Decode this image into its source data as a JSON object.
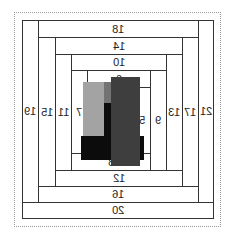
{
  "diagram": {
    "type": "log-cabin quilt block (mirrored)",
    "strips": [
      {
        "label": "21",
        "x": 198,
        "y": 20,
        "w": 16,
        "h": 183
      },
      {
        "label": "20",
        "x": 22,
        "y": 202,
        "w": 192,
        "h": 17
      },
      {
        "label": "19",
        "x": 22,
        "y": 20,
        "w": 17,
        "h": 183
      },
      {
        "label": "18",
        "x": 38,
        "y": 20,
        "w": 161,
        "h": 18
      },
      {
        "label": "17",
        "x": 182,
        "y": 37,
        "w": 17,
        "h": 150
      },
      {
        "label": "16",
        "x": 38,
        "y": 186,
        "w": 161,
        "h": 17
      },
      {
        "label": "15",
        "x": 38,
        "y": 37,
        "w": 18,
        "h": 150
      },
      {
        "label": "14",
        "x": 55,
        "y": 37,
        "w": 128,
        "h": 18
      },
      {
        "label": "13",
        "x": 166,
        "y": 54,
        "w": 17,
        "h": 117
      },
      {
        "label": "12",
        "x": 55,
        "y": 170,
        "w": 128,
        "h": 17
      },
      {
        "label": "11",
        "x": 55,
        "y": 54,
        "w": 17,
        "h": 117
      },
      {
        "label": "10",
        "x": 71,
        "y": 54,
        "w": 96,
        "h": 17
      },
      {
        "label": "9",
        "x": 150,
        "y": 70,
        "w": 17,
        "h": 101
      },
      {
        "label": "8",
        "x": 71,
        "y": 153,
        "w": 80,
        "h": 18
      },
      {
        "label": "7",
        "x": 71,
        "y": 70,
        "w": 17,
        "h": 84
      },
      {
        "label": "6",
        "x": 87,
        "y": 70,
        "w": 64,
        "h": 18
      },
      {
        "label": "5",
        "x": 134,
        "y": 87,
        "w": 17,
        "h": 67
      }
    ],
    "blocks": [
      {
        "name": "light-gray-block",
        "color": "#a3a3a3",
        "x": 83,
        "y": 82,
        "w": 21,
        "h": 56
      },
      {
        "name": "medium-gray-block",
        "color": "#737373",
        "x": 104,
        "y": 82,
        "w": 8,
        "h": 22
      },
      {
        "name": "black-block",
        "color": "#0c0c0c",
        "x": 104,
        "y": 103,
        "w": 8,
        "h": 36
      },
      {
        "name": "black-bar",
        "color": "#0c0c0c",
        "x": 81,
        "y": 136,
        "w": 63,
        "h": 24
      },
      {
        "name": "dark-gray-block",
        "color": "#3e3e3e",
        "x": 111,
        "y": 77,
        "w": 29,
        "h": 89
      }
    ]
  }
}
